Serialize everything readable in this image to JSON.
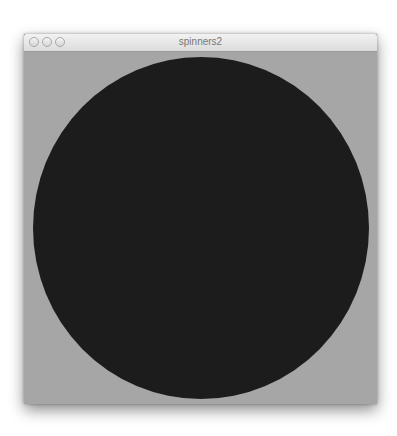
{
  "window": {
    "title": "spinners2",
    "buttons": [
      "close",
      "minimize",
      "zoom"
    ]
  },
  "canvas": {
    "background_color": "#a6a6a6",
    "shape": "circle",
    "shape_color": "#1c1c1c"
  }
}
